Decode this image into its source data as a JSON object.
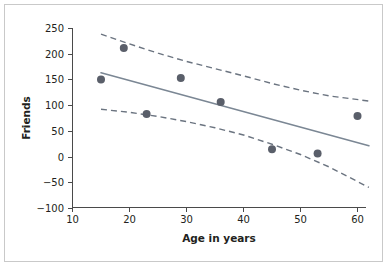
{
  "chart_data": {
    "type": "scatter",
    "title": "",
    "subtitle": "",
    "xlabel": "Age in years",
    "ylabel": "Friends",
    "xlim": [
      10,
      62
    ],
    "ylim": [
      -100,
      250
    ],
    "xticks": [
      10,
      20,
      30,
      40,
      50,
      60
    ],
    "yticks": [
      250,
      200,
      150,
      100,
      50,
      0,
      -50,
      -100
    ],
    "xtick_labels": [
      "10",
      "20",
      "30",
      "40",
      "50",
      "60"
    ],
    "ytick_labels": [
      "250",
      "200",
      "150",
      "100",
      "50",
      "0",
      "−50",
      "−100"
    ],
    "grid": false,
    "legend": false,
    "legend_position": "none",
    "point_color": "#5a5f6a",
    "fit_line_color": "#7b8794",
    "ci_line_color": "#6b7480",
    "axis_color": "#4a4a4a",
    "border_color": "#c9c9c9",
    "background_color": "#ffffff",
    "points": [
      {
        "x": 15,
        "y": 150
      },
      {
        "x": 19,
        "y": 211
      },
      {
        "x": 23,
        "y": 83
      },
      {
        "x": 29,
        "y": 153
      },
      {
        "x": 36,
        "y": 106
      },
      {
        "x": 45,
        "y": 14
      },
      {
        "x": 53,
        "y": 6
      },
      {
        "x": 60,
        "y": 79
      }
    ],
    "series": [
      {
        "name": "observations",
        "type": "scatter",
        "x": [
          15,
          19,
          23,
          29,
          36,
          45,
          53,
          60
        ],
        "values": [
          150,
          211,
          83,
          153,
          106,
          14,
          6,
          79
        ]
      },
      {
        "name": "regression-line",
        "type": "line",
        "style": "solid",
        "x": [
          15,
          62
        ],
        "values": [
          163,
          21
        ]
      },
      {
        "name": "upper-confidence-band",
        "type": "line",
        "style": "dashed",
        "x": [
          15,
          20,
          25,
          30,
          35,
          40,
          45,
          50,
          55,
          62
        ],
        "values": [
          238,
          219,
          201,
          185,
          171,
          157,
          142,
          129,
          118,
          108
        ]
      },
      {
        "name": "lower-confidence-band",
        "type": "line",
        "style": "dashed",
        "x": [
          15,
          20,
          25,
          30,
          35,
          40,
          45,
          50,
          55,
          62
        ],
        "values": [
          92,
          86,
          78,
          68,
          56,
          42,
          24,
          4,
          -20,
          -60
        ]
      }
    ]
  }
}
